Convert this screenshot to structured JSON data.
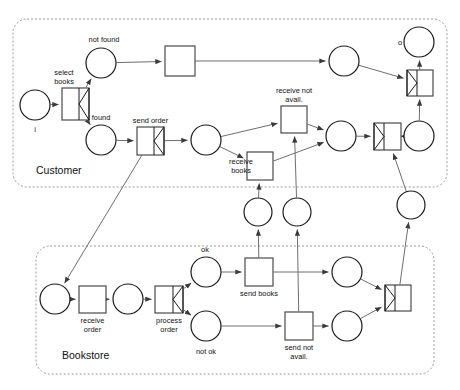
{
  "diagram": {
    "type": "petri-net",
    "title_visible": false,
    "lanes": [
      {
        "id": "customer",
        "label": "Customer"
      },
      {
        "id": "bookstore",
        "label": "Bookstore"
      }
    ],
    "colors": {
      "background": "#ffffff",
      "lane_border": "#9a9a9a",
      "place_stroke": "#1a1a1a",
      "transition_stroke": "#4a4a4a",
      "arc": "#6e6e6e",
      "text": "#111111"
    },
    "places": [
      {
        "id": "p_i",
        "label": "i",
        "lane": "customer",
        "cx": 35,
        "cy": 105,
        "r": 15,
        "label_dx": 0,
        "label_dy": 27
      },
      {
        "id": "p_notfound",
        "label": "not found",
        "lane": "customer",
        "cx": 101,
        "cy": 63,
        "r": 15,
        "label_dx": 3,
        "label_dy": -21
      },
      {
        "id": "p_found",
        "label": "found",
        "lane": "customer",
        "cx": 101,
        "cy": 140,
        "r": 15,
        "label_dx": 0,
        "label_dy": -20
      },
      {
        "id": "p_c3",
        "label": "",
        "lane": "customer",
        "cx": 206,
        "cy": 140,
        "r": 15,
        "label_dx": 0,
        "label_dy": 0
      },
      {
        "id": "p_c4",
        "label": "",
        "lane": "customer",
        "cx": 344,
        "cy": 61,
        "r": 15,
        "label_dx": 0,
        "label_dy": 0
      },
      {
        "id": "p_c5",
        "label": "",
        "lane": "customer",
        "cx": 341,
        "cy": 136,
        "r": 15,
        "label_dx": 0,
        "label_dy": 0
      },
      {
        "id": "p_c6",
        "label": "",
        "lane": "customer",
        "cx": 419,
        "cy": 136,
        "r": 15,
        "label_dx": 0,
        "label_dy": 0
      },
      {
        "id": "p_o",
        "label": "o",
        "lane": "customer",
        "cx": 419,
        "cy": 42,
        "r": 15,
        "label_dx": -19,
        "label_dy": 3
      },
      {
        "id": "p_m1",
        "label": "",
        "lane": "middle",
        "cx": 258,
        "cy": 212,
        "r": 14,
        "label_dx": 0,
        "label_dy": 0
      },
      {
        "id": "p_m2",
        "label": "",
        "lane": "middle",
        "cx": 297,
        "cy": 212,
        "r": 14,
        "label_dx": 0,
        "label_dy": 0
      },
      {
        "id": "p_m3",
        "label": "",
        "lane": "middle",
        "cx": 411,
        "cy": 205,
        "r": 14,
        "label_dx": 0,
        "label_dy": 0
      },
      {
        "id": "p_b0",
        "label": "",
        "lane": "bookstore",
        "cx": 55,
        "cy": 299,
        "r": 15,
        "label_dx": 0,
        "label_dy": 0
      },
      {
        "id": "p_b1",
        "label": "",
        "lane": "bookstore",
        "cx": 128,
        "cy": 299,
        "r": 15,
        "label_dx": 0,
        "label_dy": 0
      },
      {
        "id": "p_ok",
        "label": "ok",
        "lane": "bookstore",
        "cx": 206,
        "cy": 272,
        "r": 15,
        "label_dx": -1,
        "label_dy": -20
      },
      {
        "id": "p_notok",
        "label": "not ok",
        "lane": "bookstore",
        "cx": 206,
        "cy": 326,
        "r": 15,
        "label_dx": 0,
        "label_dy": 28
      },
      {
        "id": "p_b4",
        "label": "",
        "lane": "bookstore",
        "cx": 347,
        "cy": 272,
        "r": 15,
        "label_dx": 0,
        "label_dy": 0
      },
      {
        "id": "p_b5",
        "label": "",
        "lane": "bookstore",
        "cx": 347,
        "cy": 326,
        "r": 15,
        "label_dx": 0,
        "label_dy": 0
      }
    ],
    "transitions": [
      {
        "id": "t_select",
        "label": "select books",
        "label_lines": [
          "select",
          "books"
        ],
        "lane": "customer",
        "x": 62,
        "y": 88,
        "w": 27,
        "h": 32,
        "mark": "split",
        "label_pos": "above-left"
      },
      {
        "id": "t_t1",
        "label": "",
        "label_lines": [],
        "lane": "customer",
        "x": 165,
        "y": 46,
        "w": 30,
        "h": 30,
        "mark": "none",
        "label_pos": "below"
      },
      {
        "id": "t_sendord",
        "label": "send order",
        "label_lines": [
          "send order"
        ],
        "lane": "customer",
        "x": 137,
        "y": 127,
        "w": 27,
        "h": 28,
        "mark": "split",
        "label_pos": "above"
      },
      {
        "id": "t_recvnot",
        "label": "receive not avail.",
        "label_lines": [
          "receive not",
          "avail."
        ],
        "lane": "customer",
        "x": 281,
        "y": 106,
        "w": 26,
        "h": 27,
        "mark": "none",
        "label_pos": "above"
      },
      {
        "id": "t_recvbook",
        "label": "receive books",
        "label_lines": [
          "receive",
          "books"
        ],
        "lane": "customer",
        "x": 247,
        "y": 152,
        "w": 26,
        "h": 28,
        "mark": "none",
        "label_pos": "left"
      },
      {
        "id": "t_join1",
        "label": "",
        "label_lines": [],
        "lane": "customer",
        "x": 374,
        "y": 123,
        "w": 27,
        "h": 27,
        "mark": "join",
        "label_pos": "below"
      },
      {
        "id": "t_join2",
        "label": "",
        "label_lines": [],
        "lane": "customer",
        "x": 407,
        "y": 70,
        "w": 26,
        "h": 26,
        "mark": "join",
        "label_pos": "below"
      },
      {
        "id": "t_recvord",
        "label": "receive order",
        "label_lines": [
          "receive",
          "order"
        ],
        "lane": "bookstore",
        "x": 79,
        "y": 286,
        "w": 27,
        "h": 27,
        "mark": "none",
        "label_pos": "below"
      },
      {
        "id": "t_procord",
        "label": "process order",
        "label_lines": [
          "process",
          "order"
        ],
        "lane": "bookstore",
        "x": 155,
        "y": 286,
        "w": 28,
        "h": 27,
        "mark": "split",
        "label_pos": "below"
      },
      {
        "id": "t_sendbook",
        "label": "send books",
        "label_lines": [
          "send books"
        ],
        "lane": "bookstore",
        "x": 245,
        "y": 258,
        "w": 28,
        "h": 28,
        "mark": "none",
        "label_pos": "below"
      },
      {
        "id": "t_sendnot",
        "label": "send not avail.",
        "label_lines": [
          "send not",
          "avail."
        ],
        "lane": "bookstore",
        "x": 285,
        "y": 312,
        "w": 28,
        "h": 28,
        "mark": "none",
        "label_pos": "below"
      },
      {
        "id": "t_bjoin",
        "label": "",
        "label_lines": [],
        "lane": "bookstore",
        "x": 385,
        "y": 285,
        "w": 26,
        "h": 26,
        "mark": "join",
        "label_pos": "below"
      }
    ],
    "arcs": [
      {
        "from": "p_i",
        "to": "t_select"
      },
      {
        "from": "t_select",
        "to": "p_notfound"
      },
      {
        "from": "t_select",
        "to": "p_found"
      },
      {
        "from": "p_notfound",
        "to": "t_t1"
      },
      {
        "from": "t_t1",
        "to": "p_c4"
      },
      {
        "from": "p_found",
        "to": "t_sendord"
      },
      {
        "from": "t_sendord",
        "to": "p_c3"
      },
      {
        "from": "t_sendord",
        "to": "p_b0"
      },
      {
        "from": "p_c3",
        "to": "t_recvnot"
      },
      {
        "from": "p_c3",
        "to": "t_recvbook"
      },
      {
        "from": "t_recvnot",
        "to": "p_c5"
      },
      {
        "from": "t_recvbook",
        "to": "p_c5"
      },
      {
        "from": "p_c4",
        "to": "t_join2"
      },
      {
        "from": "p_c5",
        "to": "t_join1"
      },
      {
        "from": "t_join1",
        "to": "p_c6"
      },
      {
        "from": "p_c6",
        "to": "t_join2"
      },
      {
        "from": "t_join2",
        "to": "p_o"
      },
      {
        "from": "p_m1",
        "to": "t_recvbook"
      },
      {
        "from": "p_m2",
        "to": "t_recvnot"
      },
      {
        "from": "t_sendbook",
        "to": "p_m1"
      },
      {
        "from": "t_sendnot",
        "to": "p_m2"
      },
      {
        "from": "p_b0",
        "to": "t_recvord"
      },
      {
        "from": "t_recvord",
        "to": "p_b1"
      },
      {
        "from": "p_b1",
        "to": "t_procord"
      },
      {
        "from": "t_procord",
        "to": "p_ok"
      },
      {
        "from": "t_procord",
        "to": "p_notok"
      },
      {
        "from": "p_ok",
        "to": "t_sendbook"
      },
      {
        "from": "p_notok",
        "to": "t_sendnot"
      },
      {
        "from": "t_sendbook",
        "to": "p_b4"
      },
      {
        "from": "t_sendnot",
        "to": "p_b5"
      },
      {
        "from": "p_b4",
        "to": "t_bjoin"
      },
      {
        "from": "p_b5",
        "to": "t_bjoin"
      },
      {
        "from": "t_bjoin",
        "to": "p_m3"
      },
      {
        "from": "p_m3",
        "to": "t_join1"
      }
    ]
  }
}
